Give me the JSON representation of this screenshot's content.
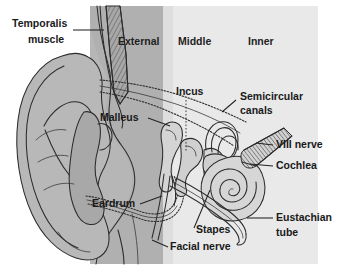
{
  "figure": {
    "type": "anatomical-diagram",
    "width": 339,
    "height": 279
  },
  "colors": {
    "page_background": "#ffffff",
    "outer_region_fill": "#b4b4b4",
    "middle_inner_region_fill": "#e8e8e8",
    "tissue_fill": "#b0b0b0",
    "tissue_fill_light": "#c6c6c6",
    "bone_fill": "#d8d8d8",
    "outline": "#2b2b2b",
    "label_text": "#1a1a1a"
  },
  "regions": [
    {
      "id": "external",
      "label": "External",
      "x": 118,
      "y": 42,
      "band_start": 90,
      "band_end": 163,
      "fill": "#b4b4b4"
    },
    {
      "id": "middle",
      "label": "Middle",
      "x": 178,
      "y": 42,
      "band_start": 163,
      "band_end": 222,
      "fill": "#e8e8e8"
    },
    {
      "id": "inner",
      "label": "Inner",
      "x": 248,
      "y": 42,
      "band_start": 222,
      "band_end": 318,
      "fill": "#e8e8e8"
    }
  ],
  "labels": [
    {
      "id": "temporalis-muscle",
      "line1": "Temporalis",
      "line2": "muscle",
      "x": 10,
      "y": 24,
      "anchor": "start",
      "leader": "M 85,30 L 104,30"
    },
    {
      "id": "external-canal",
      "line1": "External",
      "line2": "",
      "x": 118,
      "y": 42,
      "anchor": "start",
      "leader": ""
    },
    {
      "id": "middle-ear",
      "line1": "Middle",
      "line2": "",
      "x": 178,
      "y": 42,
      "anchor": "start",
      "leader": ""
    },
    {
      "id": "inner-ear",
      "line1": "Inner",
      "line2": "",
      "x": 248,
      "y": 42,
      "anchor": "start",
      "leader": ""
    },
    {
      "id": "malleus",
      "line1": "Malleus",
      "line2": "",
      "x": 100,
      "y": 118,
      "anchor": "start",
      "leader": "M 150,118 L 172,127"
    },
    {
      "id": "incus",
      "line1": "Incus",
      "line2": "",
      "x": 178,
      "y": 92,
      "anchor": "start",
      "leader": "M 186,100 L 186,150"
    },
    {
      "id": "semicircular-canals",
      "line1": "Semicircular",
      "line2": "canals",
      "x": 240,
      "y": 97,
      "anchor": "start",
      "leader": "M 236,100 L 222,110"
    },
    {
      "id": "viii-nerve",
      "line1": "VIII nerve",
      "line2": "",
      "x": 276,
      "y": 145,
      "anchor": "start",
      "leader": "M 273,145 L 258,142"
    },
    {
      "id": "cochlea",
      "line1": "Cochlea",
      "line2": "",
      "x": 276,
      "y": 166,
      "anchor": "start",
      "leader": "M 273,166 L 248,160"
    },
    {
      "id": "eustachian-tube",
      "line1": "Eustachian",
      "line2": "tube",
      "x": 276,
      "y": 218,
      "anchor": "start",
      "leader": "M 273,218 L 246,218"
    },
    {
      "id": "eardrum",
      "line1": "Eardrum",
      "line2": "",
      "x": 92,
      "y": 204,
      "anchor": "start",
      "leader": "M 140,204 L 160,196"
    },
    {
      "id": "stapes",
      "line1": "Stapes",
      "line2": "",
      "x": 196,
      "y": 230,
      "anchor": "start",
      "leader": "M 193,230 L 184,206"
    },
    {
      "id": "facial-nerve",
      "line1": "Facial nerve",
      "line2": "",
      "x": 170,
      "y": 247,
      "anchor": "start",
      "leader": "M 167,247 L 152,240"
    }
  ]
}
